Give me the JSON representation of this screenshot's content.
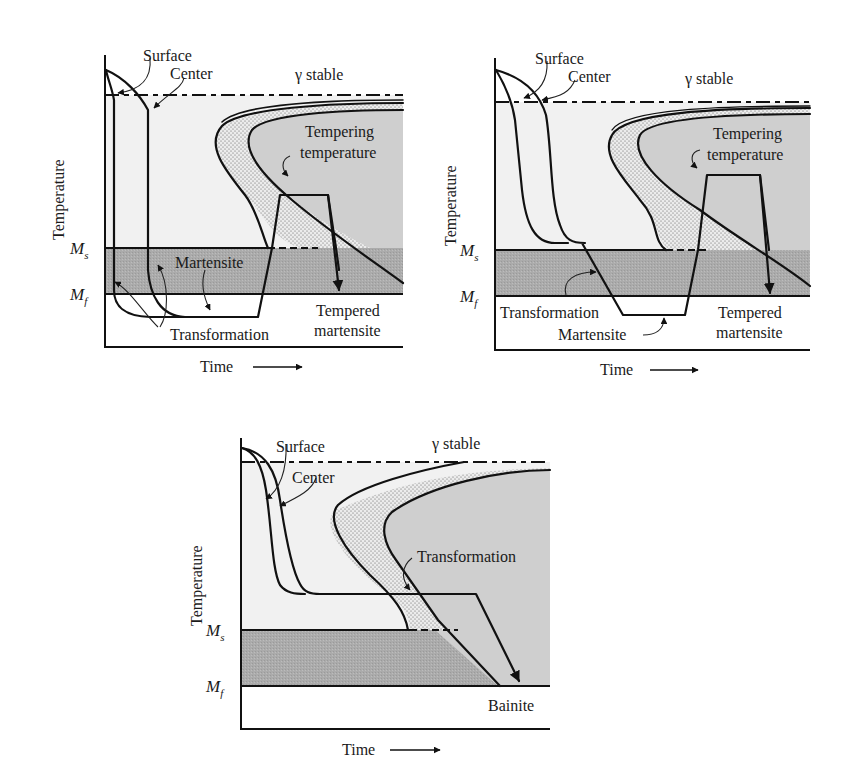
{
  "colors": {
    "background": "#ffffff",
    "austenite_region": "#f1f1f1",
    "stippled_band": "#e6e6e6",
    "transformation_region": "#cfcfcf",
    "martensite_band": "#a9a9a9",
    "line": "#111111"
  },
  "panels": [
    {
      "id": "martempering-conventional",
      "labels": {
        "surface": "Surface",
        "center": "Center",
        "gamma_stable": "γ stable",
        "tempering_line1": "Tempering",
        "tempering_line2": "temperature",
        "martensite": "Martensite",
        "transformation": "Transformation",
        "tempered_line1": "Tempered",
        "tempered_line2": "martensite",
        "ms": "M",
        "ms_sub": "s",
        "mf": "M",
        "mf_sub": "f",
        "y_axis": "Temperature",
        "x_axis": "Time"
      }
    },
    {
      "id": "martempering",
      "labels": {
        "surface": "Surface",
        "center": "Center",
        "gamma_stable": "γ stable",
        "tempering_line1": "Tempering",
        "tempering_line2": "temperature",
        "transformation": "Transformation",
        "martensite": "Martensite",
        "tempered_line1": "Tempered",
        "tempered_line2": "martensite",
        "ms": "M",
        "ms_sub": "s",
        "mf": "M",
        "mf_sub": "f",
        "y_axis": "Temperature",
        "x_axis": "Time"
      }
    },
    {
      "id": "austempering",
      "labels": {
        "surface": "Surface",
        "center": "Center",
        "gamma_stable": "γ stable",
        "transformation": "Transformation",
        "bainite": "Bainite",
        "ms": "M",
        "ms_sub": "s",
        "mf": "M",
        "mf_sub": "f",
        "y_axis": "Temperature",
        "x_axis": "Time"
      }
    }
  ]
}
